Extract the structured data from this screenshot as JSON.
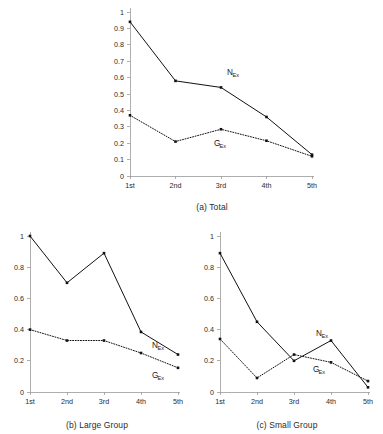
{
  "figure": {
    "background_color": "#ffffff",
    "line_color": "#111111",
    "axis_color": "#9a9a9a",
    "panels": [
      "a",
      "b",
      "c"
    ]
  },
  "series_labels": {
    "n_base": "N",
    "n_sub": "Ex",
    "g_base": "G",
    "g_sub": "Ex",
    "n_full": "N_Ex",
    "g_full": "G_Ex"
  },
  "panel_a": {
    "caption": "(a) Total",
    "label_n": "N",
    "label_n_sub": "Ex",
    "label_g": "G",
    "label_g_sub": "Ex"
  },
  "panel_b": {
    "caption": "(b) Large Group",
    "label_n": "N",
    "label_n_sub": "Ex",
    "label_g": "G",
    "label_g_sub": "Ex"
  },
  "panel_c": {
    "caption": "(c) Small Group",
    "label_n": "N",
    "label_n_sub": "Ex",
    "label_g": "G",
    "label_g_sub": "Ex"
  },
  "chart_data": [
    {
      "type": "line",
      "title": "(a) Total",
      "xlabel": "",
      "ylabel": "",
      "categories": [
        "1st",
        "2nd",
        "3rd",
        "4th",
        "5th"
      ],
      "yticks": [
        0,
        0.1,
        0.2,
        0.3,
        0.4,
        0.5,
        0.6,
        0.7,
        0.8,
        0.9,
        1
      ],
      "ytick_labels": [
        "0",
        "0.1",
        "0.2",
        "0.3",
        "0.4",
        "0.5",
        "0.6",
        "0.7",
        "0.8",
        "0.9",
        "1"
      ],
      "ylim": [
        0,
        1
      ],
      "grid": false,
      "legend": "inline-annotations",
      "series": [
        {
          "name": "N_Ex",
          "style": "solid",
          "marker": "square",
          "values": [
            0.94,
            0.58,
            0.54,
            0.36,
            0.13
          ]
        },
        {
          "name": "G_Ex",
          "style": "dotted",
          "marker": "square",
          "values": [
            0.37,
            0.21,
            0.285,
            0.215,
            0.12
          ]
        }
      ]
    },
    {
      "type": "line",
      "title": "(b) Large Group",
      "xlabel": "",
      "ylabel": "",
      "categories": [
        "1st",
        "2nd",
        "3rd",
        "4th",
        "5th"
      ],
      "yticks": [
        0,
        0.2,
        0.4,
        0.6,
        0.8,
        1
      ],
      "ytick_labels": [
        "0",
        "0.2",
        "0.4",
        "0.6",
        "0.8",
        "1"
      ],
      "ylim": [
        0,
        1
      ],
      "grid": false,
      "legend": "inline-annotations",
      "series": [
        {
          "name": "N_Ex",
          "style": "solid",
          "marker": "square",
          "values": [
            1.0,
            0.7,
            0.89,
            0.385,
            0.24
          ]
        },
        {
          "name": "G_Ex",
          "style": "dotted",
          "marker": "square",
          "values": [
            0.4,
            0.33,
            0.33,
            0.25,
            0.155
          ]
        }
      ]
    },
    {
      "type": "line",
      "title": "(c) Small Group",
      "xlabel": "",
      "ylabel": "",
      "categories": [
        "1st",
        "2nd",
        "3rd",
        "4th",
        "5th"
      ],
      "yticks": [
        0,
        0.2,
        0.4,
        0.6,
        0.8,
        1
      ],
      "ytick_labels": [
        "0",
        "0.2",
        "0.4",
        "0.6",
        "0.8",
        "1"
      ],
      "ylim": [
        0,
        1
      ],
      "grid": false,
      "legend": "inline-annotations",
      "series": [
        {
          "name": "N_Ex",
          "style": "solid",
          "marker": "square",
          "values": [
            0.89,
            0.45,
            0.2,
            0.33,
            0.03
          ]
        },
        {
          "name": "G_Ex",
          "style": "dotted",
          "marker": "square",
          "values": [
            0.34,
            0.09,
            0.24,
            0.19,
            0.07
          ]
        }
      ]
    }
  ]
}
